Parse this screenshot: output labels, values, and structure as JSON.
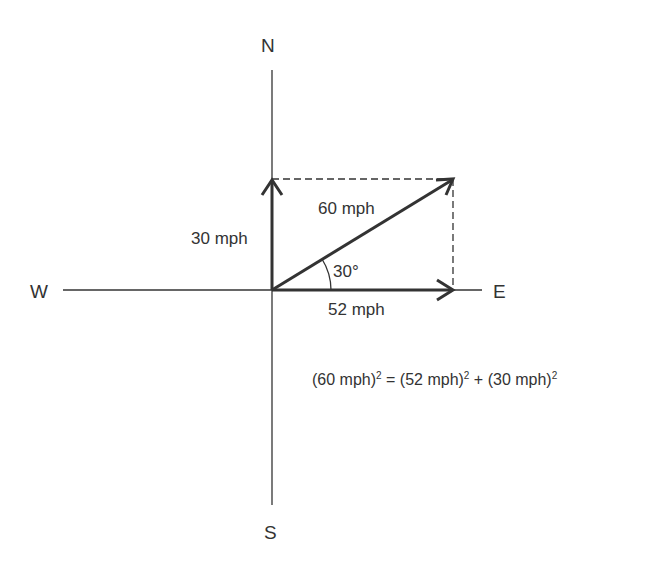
{
  "compass": {
    "north": "N",
    "south": "S",
    "west": "W",
    "east": "E"
  },
  "vectors": {
    "north_component": {
      "label": "30 mph",
      "value": 30,
      "unit": "mph",
      "direction": "N"
    },
    "east_component": {
      "label": "52 mph",
      "value": 52,
      "unit": "mph",
      "direction": "E"
    },
    "resultant": {
      "label": "60 mph",
      "value": 60,
      "unit": "mph"
    }
  },
  "angle": {
    "label": "30°",
    "value": 30
  },
  "equation": {
    "left_term": "(60 mph)",
    "equals": " = ",
    "middle_term": "(52 mph)",
    "plus": " + ",
    "right_term": "(30 mph)",
    "exponent": "2"
  },
  "colors": {
    "line": "#333333",
    "text": "#333333",
    "background": "#ffffff"
  }
}
